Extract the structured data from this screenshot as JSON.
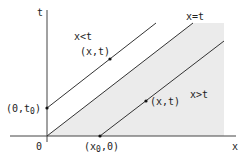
{
  "diagram": {
    "axes": {
      "x_label": "x",
      "t_label": "t",
      "origin_label": "0"
    },
    "lines": {
      "diagonal_label": "x=t"
    },
    "regions": {
      "upper_label": "x<t",
      "lower_label": "x>t"
    },
    "points": {
      "upper_point_label": "(x,t)",
      "lower_point_label": "(x,t)",
      "t_intercept_label": "(0,t",
      "t_intercept_sub": "0",
      "x_intercept_label": "(x",
      "x_intercept_sub": "0",
      "x_intercept_tail": ",0)"
    },
    "colors": {
      "shade": "#ebebeb",
      "line": "#333333"
    }
  }
}
